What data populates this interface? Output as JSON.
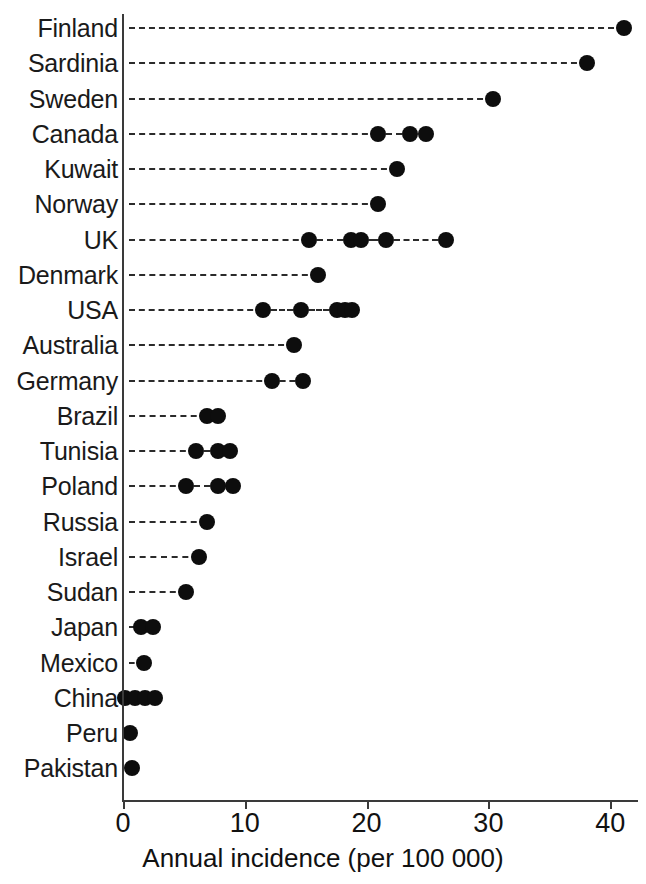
{
  "chart_data": {
    "type": "scatter",
    "title": "",
    "subtitle": "",
    "xlabel": "Annual incidence (per 100 000)",
    "ylabel": "",
    "xlim": [
      0,
      42.5
    ],
    "xticks": [
      0,
      10,
      20,
      30,
      40
    ],
    "xtick_labels": [
      "0",
      "10",
      "20",
      "30",
      "40"
    ],
    "grid": false,
    "legend": null,
    "orientation": "horizontal",
    "marker": "filled-circle",
    "marker_color": "#0d0d0d",
    "leader_line_style": "dashed",
    "categories": [
      "Finland",
      "Sardinia",
      "Sweden",
      "Canada",
      "Kuwait",
      "Norway",
      "UK",
      "Denmark",
      "USA",
      "Australia",
      "Germany",
      "Brazil",
      "Tunisia",
      "Poland",
      "Russia",
      "Israel",
      "Sudan",
      "Japan",
      "Mexico",
      "China",
      "Peru",
      "Pakistan"
    ],
    "points": [
      {
        "category": "Finland",
        "values": [
          41.1
        ]
      },
      {
        "category": "Sardinia",
        "values": [
          38.1
        ]
      },
      {
        "category": "Sweden",
        "values": [
          30.4
        ]
      },
      {
        "category": "Canada",
        "values": [
          20.9,
          23.6,
          24.9
        ]
      },
      {
        "category": "Kuwait",
        "values": [
          22.5
        ]
      },
      {
        "category": "Norway",
        "values": [
          20.9
        ]
      },
      {
        "category": "UK",
        "values": [
          15.3,
          18.7,
          19.5,
          21.6,
          26.5
        ]
      },
      {
        "category": "Denmark",
        "values": [
          16.0
        ]
      },
      {
        "category": "USA",
        "values": [
          11.5,
          14.6,
          17.6,
          18.2,
          18.8
        ]
      },
      {
        "category": "Australia",
        "values": [
          14.0
        ]
      },
      {
        "category": "Germany",
        "values": [
          12.2,
          14.8
        ]
      },
      {
        "category": "Brazil",
        "values": [
          6.9,
          7.8
        ]
      },
      {
        "category": "Tunisia",
        "values": [
          6.0,
          7.8,
          8.8
        ]
      },
      {
        "category": "Poland",
        "values": [
          5.2,
          7.8,
          9.0
        ]
      },
      {
        "category": "Russia",
        "values": [
          6.9
        ]
      },
      {
        "category": "Israel",
        "values": [
          6.2
        ]
      },
      {
        "category": "Sudan",
        "values": [
          5.2
        ]
      },
      {
        "category": "Japan",
        "values": [
          1.5,
          2.5
        ]
      },
      {
        "category": "Mexico",
        "values": [
          1.7
        ]
      },
      {
        "category": "China",
        "values": [
          0.2,
          1.0,
          1.8,
          2.6
        ]
      },
      {
        "category": "Peru",
        "values": [
          0.6
        ]
      },
      {
        "category": "Pakistan",
        "values": [
          0.7
        ]
      }
    ]
  },
  "axis": {
    "x_title": "Annual incidence (per 100 000)",
    "tick_labels": [
      "0",
      "10",
      "20",
      "30",
      "40"
    ]
  }
}
